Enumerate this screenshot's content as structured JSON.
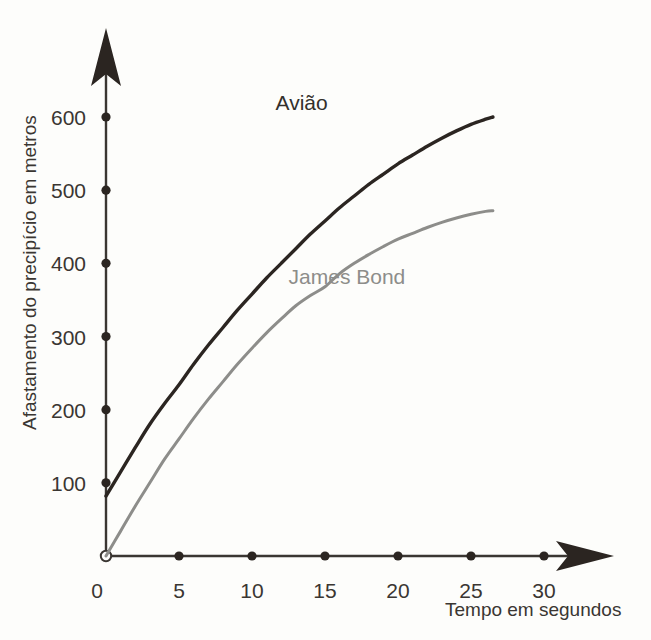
{
  "chart_data": {
    "type": "line",
    "title": "",
    "subtitle": "",
    "xlabel": "Tempo em segundos",
    "ylabel": "Afastamento do precipício em metros",
    "xlim": [
      0,
      32
    ],
    "ylim": [
      0,
      660
    ],
    "grid": false,
    "legend_position": "inline-annotation",
    "xticks": [
      0,
      5,
      10,
      15,
      20,
      25,
      30
    ],
    "xtick_labels": [
      "0",
      "5",
      "10",
      "15",
      "20",
      "25",
      "30"
    ],
    "yticks": [
      100,
      200,
      300,
      400,
      500,
      600
    ],
    "ytick_labels": [
      "100",
      "200",
      "300",
      "400",
      "500",
      "600"
    ],
    "origin_marker": "open-circle",
    "series": [
      {
        "name": "Avião",
        "color": "#2b2521",
        "x": [
          0,
          1,
          2,
          3,
          4,
          5,
          6,
          7,
          8,
          9,
          10,
          11,
          12,
          13,
          14,
          15,
          16,
          17,
          18,
          19,
          20,
          21,
          22,
          23,
          24,
          25,
          26,
          26.5
        ],
        "values": [
          82,
          115,
          148,
          180,
          208,
          234,
          262,
          288,
          312,
          336,
          358,
          380,
          400,
          420,
          440,
          458,
          476,
          492,
          508,
          522,
          536,
          548,
          560,
          571,
          581,
          590,
          597,
          600
        ]
      },
      {
        "name": "James Bond",
        "color": "#8d8d8a",
        "x": [
          0,
          1,
          2,
          3,
          4,
          5,
          6,
          7,
          8,
          9,
          10,
          11,
          12,
          13,
          14,
          15,
          16,
          17,
          18,
          19,
          20,
          21,
          22,
          23,
          24,
          25,
          26,
          26.5
        ],
        "values": [
          0,
          34,
          68,
          100,
          132,
          160,
          188,
          214,
          238,
          262,
          284,
          305,
          324,
          342,
          356,
          368,
          386,
          400,
          412,
          423,
          433,
          441,
          449,
          456,
          462,
          467,
          471,
          472
        ]
      }
    ],
    "annotations": [
      {
        "text": "Avião",
        "x": 13.4,
        "y": 610,
        "color": "#33302c"
      },
      {
        "text": "James Bond",
        "x": 16.5,
        "y": 372,
        "color": "#8d8d8a"
      }
    ]
  },
  "axis": {
    "y_arrow_name": "y-axis-arrow",
    "x_arrow_name": "x-axis-arrow",
    "axis_color": "#3a3632"
  }
}
